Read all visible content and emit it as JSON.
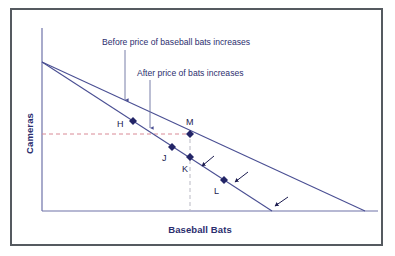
{
  "figure": {
    "width": 395,
    "height": 256,
    "background": "#ffffff",
    "frame_color": "#555a60"
  },
  "axes": {
    "ylabel": "Cameras",
    "xlabel": "Baseball Bats",
    "label_color": "#2b2e6e",
    "axis_color": "#6e72a8",
    "origin_px": {
      "x": 42,
      "y": 211
    },
    "x_end_px": 378,
    "y_top_px": 28
  },
  "annotations": [
    {
      "id": "before",
      "text": "Before price of baseball bats increases",
      "color": "#2b2e6e",
      "arrow_from": {
        "x": 125,
        "y": 50
      },
      "arrow_to": {
        "x": 125,
        "y": 100
      }
    },
    {
      "id": "after",
      "text": "After price of bats increases",
      "color": "#2b2e6e",
      "arrow_from": {
        "x": 150,
        "y": 80
      },
      "arrow_to": {
        "x": 150,
        "y": 128
      }
    }
  ],
  "shift_arrows": [
    {
      "from": {
        "x": 214,
        "y": 156
      },
      "to": {
        "x": 202,
        "y": 166
      }
    },
    {
      "from": {
        "x": 248,
        "y": 172
      },
      "to": {
        "x": 235,
        "y": 182
      }
    },
    {
      "from": {
        "x": 288,
        "y": 197
      },
      "to": {
        "x": 275,
        "y": 206
      }
    }
  ],
  "chart_data": {
    "type": "line",
    "title": "",
    "xlabel": "Baseball Bats",
    "ylabel": "Cameras",
    "grid": false,
    "axis_ticks": false,
    "legend_position": "inline-annotations",
    "series": [
      {
        "name": "Before price of baseball bats increases",
        "role": "original budget constraint",
        "color": "#4a4f93",
        "points_px": [
          {
            "x": 42,
            "y": 62
          },
          {
            "x": 365,
            "y": 211
          }
        ]
      },
      {
        "name": "After price of bats increases",
        "role": "new budget constraint",
        "color": "#4a4f93",
        "points_px": [
          {
            "x": 42,
            "y": 62
          },
          {
            "x": 272,
            "y": 211
          }
        ]
      }
    ],
    "points": [
      {
        "label": "H",
        "x_px": 133,
        "y_px": 121,
        "on_line": "before",
        "label_dx": -16,
        "label_dy": -2
      },
      {
        "label": "M",
        "x_px": 190,
        "y_px": 134,
        "on_line": "before",
        "label_dx": -4,
        "label_dy": -17
      },
      {
        "label": "J",
        "x_px": 172,
        "y_px": 147,
        "on_line": "after",
        "label_dx": -10,
        "label_dy": 6
      },
      {
        "label": "K",
        "x_px": 190,
        "y_px": 157,
        "on_line": "after",
        "label_dx": -8,
        "label_dy": 7
      },
      {
        "label": "L",
        "x_px": 224,
        "y_px": 180,
        "on_line": "after",
        "label_dx": -10,
        "label_dy": 6
      }
    ],
    "marker": {
      "shape": "diamond",
      "size_px": 8,
      "fill": "#232567"
    },
    "reference_lines": [
      {
        "id": "horizontal-camera-level",
        "orientation": "horizontal",
        "color": "#d98a96",
        "dash": "4,3",
        "from": {
          "x": 42,
          "y": 134
        },
        "to": {
          "x": 192,
          "y": 134
        }
      },
      {
        "id": "vertical-bats-level",
        "orientation": "vertical",
        "color": "#b9b9c4",
        "dash": "4,3",
        "from": {
          "x": 190,
          "y": 132
        },
        "to": {
          "x": 190,
          "y": 211
        }
      }
    ]
  }
}
